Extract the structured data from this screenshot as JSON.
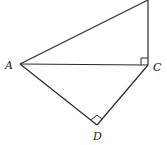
{
  "diagram": {
    "type": "geometry",
    "points": {
      "A": {
        "label": "A",
        "x": 20,
        "y": 64
      },
      "B": {
        "label": "",
        "x": 148,
        "y": 0
      },
      "C": {
        "label": "C",
        "x": 148,
        "y": 65
      },
      "D": {
        "label": "D",
        "x": 97,
        "y": 125
      }
    },
    "segments": [
      [
        "A",
        "B"
      ],
      [
        "B",
        "C"
      ],
      [
        "A",
        "C"
      ],
      [
        "A",
        "D"
      ],
      [
        "D",
        "C"
      ]
    ],
    "right_angles": [
      "C (angle ACB)",
      "D (angle ADC)"
    ],
    "labels": {
      "A": "A",
      "C": "C",
      "D": "D"
    },
    "colors": {
      "stroke": "#2a2a2a",
      "background": "#ffffff"
    }
  }
}
